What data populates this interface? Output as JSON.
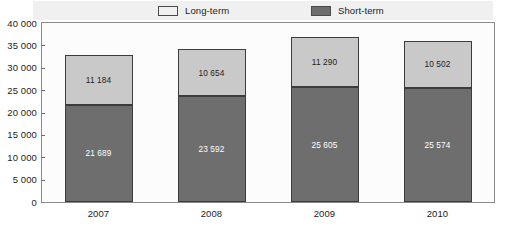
{
  "chart_data": {
    "type": "bar",
    "subtype": "stacked-vertical",
    "title": "",
    "subtitle": "",
    "xlabel": "",
    "ylabel": "",
    "categories": [
      "2007",
      "2008",
      "2009",
      "2010"
    ],
    "series": [
      {
        "name": "Short-term",
        "color": "#6e6e6e",
        "values": [
          21689,
          23592,
          25605,
          25574
        ],
        "labels": [
          "21 689",
          "23 592",
          "25 605",
          "25 574"
        ]
      },
      {
        "name": "Long-term",
        "color": "#c9c9c9",
        "values": [
          11184,
          10654,
          11290,
          10502
        ],
        "labels": [
          "11 184",
          "10 654",
          "11 290",
          "10 502"
        ]
      }
    ],
    "stack_totals": [
      32873,
      34246,
      36895,
      36076
    ],
    "ylim": [
      0,
      40000
    ],
    "ytick_values": [
      40000,
      35000,
      30000,
      25000,
      20000,
      15000,
      10000,
      5000,
      0
    ],
    "ytick_labels": [
      "40 000",
      "35 000",
      "30 000",
      "25 000",
      "20 000",
      "15 000",
      "10 000",
      "5 000",
      "0"
    ],
    "grid": false,
    "legend_position": "top",
    "legend_entries": [
      {
        "label": "Long-term",
        "color": "#c9c9c9"
      },
      {
        "label": "Short-term",
        "color": "#6e6e6e"
      }
    ]
  },
  "colors": {
    "long_term": "#c9c9c9",
    "short_term": "#6e6e6e",
    "bar_border": "#3c3c3c",
    "frame": "#8a8a8a",
    "legend_band": "#f0f0f0",
    "plot_background": "#fcfcfc",
    "text": "#1c1c1c",
    "value_text_on_dark": "#ffffff"
  }
}
